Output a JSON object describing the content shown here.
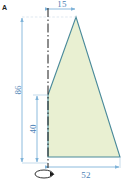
{
  "drawing": {
    "title_mark": "A",
    "colors": {
      "profile_fill": "#e9f0d2",
      "profile_stroke": "#4a8a9a",
      "dimension_line": "#7fb3d9",
      "dimension_text": "#4a7fb5",
      "axis_line": "#1a1a1a",
      "background": "#ffffff"
    },
    "profile": {
      "name": "revolution-profile",
      "vertices": [
        {
          "x": 48,
          "y": 95
        },
        {
          "x": 76,
          "y": 17
        },
        {
          "x": 120,
          "y": 157
        },
        {
          "x": 48,
          "y": 157
        }
      ]
    },
    "axis": {
      "name": "revolution-axis",
      "x": 48,
      "y_top": 8,
      "y_bottom": 170,
      "symbol": "rotation-arrow"
    },
    "dimensions": [
      {
        "id": "top-width",
        "label": "15",
        "orientation": "horizontal",
        "from": 48,
        "to": 76,
        "position": 9,
        "text_x": 62,
        "text_y": 8
      },
      {
        "id": "overall-height",
        "label": "86",
        "orientation": "vertical",
        "from": 17,
        "to": 163,
        "position": 22,
        "text_x": 21,
        "text_y": 90
      },
      {
        "id": "lower-height",
        "label": "40",
        "orientation": "vertical",
        "from": 95,
        "to": 163,
        "position": 37,
        "text_x": 36,
        "text_y": 129
      },
      {
        "id": "base-width",
        "label": "52",
        "orientation": "horizontal",
        "from": 48,
        "to": 120,
        "position": 167,
        "text_x": 84,
        "text_y": 176
      }
    ]
  }
}
